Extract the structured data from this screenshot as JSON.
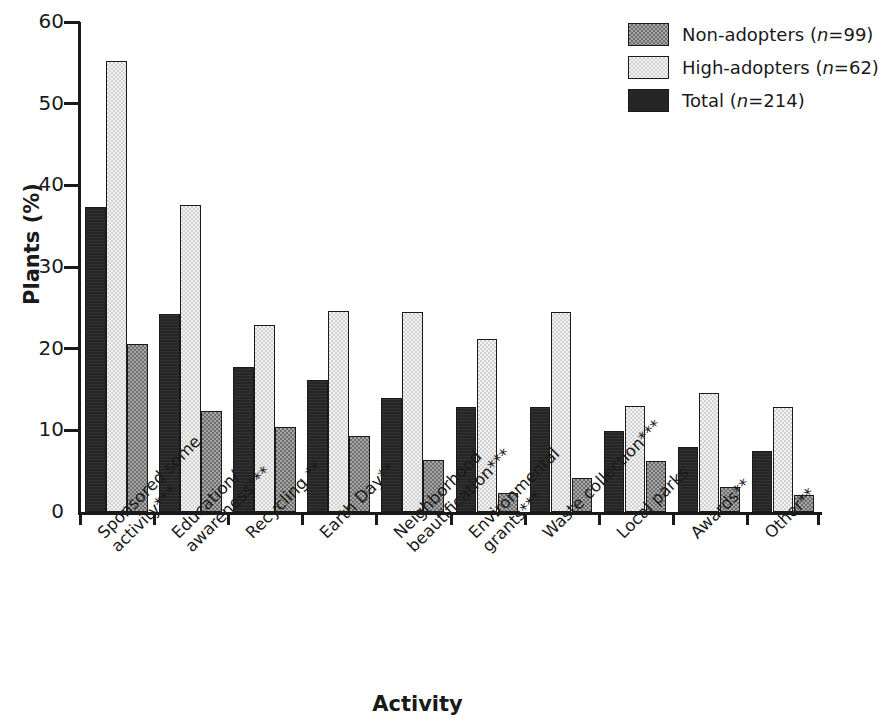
{
  "chart_data": {
    "type": "bar",
    "title": "",
    "xlabel": "Activity",
    "ylabel": "Plants (%)",
    "ylim": [
      0,
      60
    ],
    "yticks": [
      0,
      10,
      20,
      30,
      40,
      50,
      60
    ],
    "ytick_labels": [
      "0",
      "10",
      "20",
      "30",
      "40",
      "50",
      "60"
    ],
    "grid": false,
    "legend_position": "top-right",
    "bar_order_in_group": [
      "Total",
      "High-adopters",
      "Non-adopters"
    ],
    "categories": [
      "Sponsored some activity***",
      "Education/ awareness***",
      "Recycling **",
      "Earth Day**",
      "Neighborhood beautification***",
      "Environmental grants***",
      "Waste collection***",
      "Local parks",
      "Awards**",
      "Other**"
    ],
    "category_lines": [
      [
        "Sponsored some",
        "activity***"
      ],
      [
        "Education/",
        "awareness***"
      ],
      [
        "Recycling **",
        ""
      ],
      [
        "Earth Day**",
        ""
      ],
      [
        "Neighborhood",
        "beautification***"
      ],
      [
        "Environmental",
        "grants***"
      ],
      [
        "Waste collection***",
        ""
      ],
      [
        "Local parks",
        ""
      ],
      [
        "Awards**",
        ""
      ],
      [
        "Other**",
        ""
      ]
    ],
    "series": [
      {
        "name": "Non-adopters (n=99)",
        "key": "non",
        "fill": "gray-checker",
        "color": "#8a8a8a",
        "values": [
          20.6,
          12.4,
          10.4,
          9.3,
          6.4,
          2.3,
          4.2,
          6.3,
          3.1,
          2.1
        ]
      },
      {
        "name": "High-adopters (n=62)",
        "key": "high",
        "fill": "light-checker",
        "color": "#e3e3e3",
        "values": [
          55.2,
          37.6,
          22.9,
          24.6,
          24.5,
          21.2,
          24.5,
          13.0,
          14.6,
          12.9
        ]
      },
      {
        "name": "Total (n=214)",
        "key": "total",
        "fill": "solid-black",
        "color": "#262626",
        "values": [
          37.4,
          24.3,
          17.7,
          16.2,
          13.9,
          12.8,
          12.8,
          9.9,
          8.0,
          7.5
        ]
      }
    ]
  },
  "legend": {
    "items": [
      {
        "label_main": "Non-adopters (",
        "label_italic": "n",
        "label_tail": "=99)",
        "key": "non"
      },
      {
        "label_main": "High-adopters (",
        "label_italic": "n",
        "label_tail": "=62)",
        "key": "high"
      },
      {
        "label_main": "Total (",
        "label_italic": "n",
        "label_tail": "=214)",
        "key": "total"
      }
    ]
  },
  "axes": {
    "ylabel": "Plants (%)",
    "xlabel": "Activity"
  }
}
